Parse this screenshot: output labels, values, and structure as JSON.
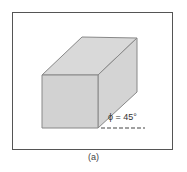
{
  "figure": {
    "caption": "(a)",
    "angle_label": "ϕ = 45°",
    "shape": "cube",
    "colors": {
      "face_fill": "#d4d4d4",
      "edge": "#888888",
      "frame": "#555555",
      "dashed_line": "#444444"
    }
  }
}
